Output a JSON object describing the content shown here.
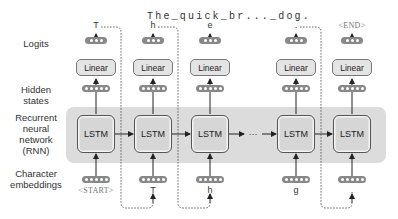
{
  "title": "The_quick_br..._dog.",
  "row_labels": {
    "logits": "Logits",
    "hidden_states": "Hidden\nstates",
    "rnn": "Recurrent\nneural\nnetwork\n(RNN)",
    "embeddings": "Character\nembeddings"
  },
  "columns": [
    {
      "output": "T",
      "linear": "Linear",
      "cell": "LSTM",
      "input": "<START>",
      "input_special": true
    },
    {
      "output": "h",
      "linear": "Linear",
      "cell": "LSTM",
      "input": "T",
      "input_special": false
    },
    {
      "output": "e",
      "linear": "Linear",
      "cell": "LSTM",
      "input": "h",
      "input_special": false
    },
    {
      "output": ".",
      "linear": "Linear",
      "cell": "LSTM",
      "input": "g",
      "input_special": false
    },
    {
      "output": "<END>",
      "linear": "Linear",
      "cell": "LSTM",
      "input": ".",
      "input_special": true
    }
  ],
  "ellipsis": "···",
  "colors": {
    "band": "#dcdcdc",
    "cell_fill": "#d6d6d6",
    "vector": "#888888",
    "special_token": "#777777"
  }
}
